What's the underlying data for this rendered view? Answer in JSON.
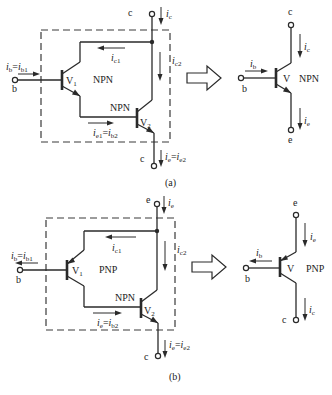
{
  "figure": {
    "panel_a": {
      "caption": "(a)",
      "composite": {
        "terminal_top": "c",
        "terminal_bottom": "c",
        "terminal_base": "b",
        "current_top": "i",
        "current_top_sub": "c",
        "current_base": "i",
        "current_base_sub": "b",
        "current_base_eq": "=",
        "current_base_rhs": "i",
        "current_base_rhs_sub": "b1",
        "ic1": "i",
        "ic1_sub": "c1",
        "ic2": "i",
        "ic2_sub": "c2",
        "ie1_lhs": "i",
        "ie1_lhs_sub": "e1",
        "ie1_eq": "=",
        "ie1_rhs": "i",
        "ie1_rhs_sub": "b2",
        "ie_lhs": "i",
        "ie_lhs_sub": "e",
        "ie_eq": "=",
        "ie_rhs": "i",
        "ie_rhs_sub": "e2",
        "v1_label": "V",
        "v1_sub": "1",
        "v1_type": "NPN",
        "v2_label": "V",
        "v2_sub": "2",
        "v2_type": "NPN"
      },
      "equivalent": {
        "terminal_top": "c",
        "terminal_bottom": "e",
        "terminal_base": "b",
        "current_top": "i",
        "current_top_sub": "c",
        "current_bottom": "i",
        "current_bottom_sub": "e",
        "current_base": "i",
        "current_base_sub": "b",
        "label": "V",
        "type": "NPN"
      }
    },
    "panel_b": {
      "caption": "(b)",
      "composite": {
        "terminal_top": "e",
        "terminal_bottom": "c",
        "terminal_base": "b",
        "current_top": "i",
        "current_top_sub": "e",
        "current_base": "i",
        "current_base_sub": "b",
        "current_base_eq": "=",
        "current_base_rhs": "i",
        "current_base_rhs_sub": "b1",
        "ic1": "i",
        "ic1_sub": "c1",
        "ic2": "i",
        "ic2_sub": "c2",
        "ie1_lhs": "i",
        "ie1_lhs_sub": "e",
        "ie1_eq": "=",
        "ie1_rhs": "i",
        "ie1_rhs_sub": "b2",
        "ie_lhs": "i",
        "ie_lhs_sub": "e",
        "ie_eq": "=",
        "ie_rhs": "i",
        "ie_rhs_sub": "e2",
        "v1_label": "V",
        "v1_sub": "1",
        "v1_type": "PNP",
        "v2_label": "V",
        "v2_sub": "2",
        "v2_type": "NPN"
      },
      "equivalent": {
        "terminal_top": "e",
        "terminal_bottom": "c",
        "terminal_base": "b",
        "current_top": "i",
        "current_top_sub": "e",
        "current_bottom": "i",
        "current_bottom_sub": "c",
        "current_base": "i",
        "current_base_sub": "b",
        "label": "V",
        "type": "PNP"
      }
    },
    "transform_arrow_icon": "hollow-right-arrow"
  }
}
